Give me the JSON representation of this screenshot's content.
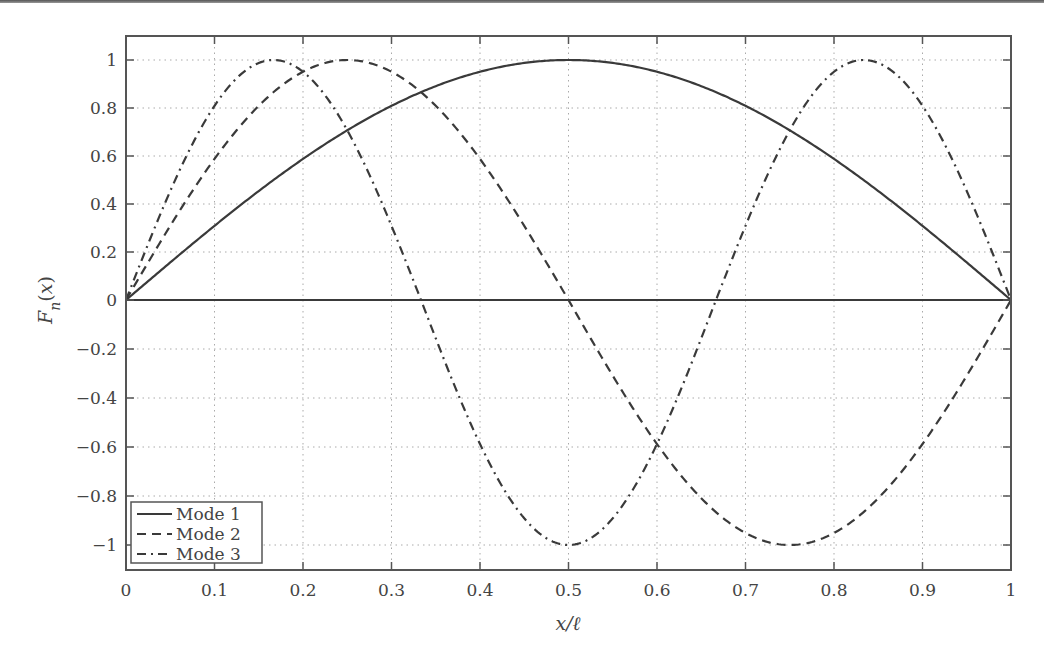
{
  "chart_data": {
    "type": "line",
    "title": "",
    "xlabel": "x/ℓ",
    "ylabel": "F_n(x)",
    "xlim": [
      0,
      1
    ],
    "ylim": [
      -1.1,
      1.1
    ],
    "grid": true,
    "legend_position": "lower left",
    "x_ticks": [
      "0",
      "0.1",
      "0.2",
      "0.3",
      "0.4",
      "0.5",
      "0.6",
      "0.7",
      "0.8",
      "0.9",
      "1"
    ],
    "y_ticks": [
      "1",
      "0.8",
      "0.6",
      "0.4",
      "0.2",
      "0",
      "-0.2",
      "-0.4",
      "-0.6",
      "-0.8",
      "-1"
    ],
    "y_tick_values": [
      1,
      0.8,
      0.6,
      0.4,
      0.2,
      0,
      -0.2,
      -0.4,
      -0.6,
      -0.8,
      -1
    ],
    "series": [
      {
        "name": "Mode 1",
        "style": "solid",
        "function": "sin(1*pi*x)",
        "x": [
          0,
          0.1,
          0.2,
          0.3,
          0.4,
          0.5,
          0.6,
          0.7,
          0.8,
          0.9,
          1
        ],
        "values": [
          0,
          0.31,
          0.59,
          0.81,
          0.95,
          1,
          0.95,
          0.81,
          0.59,
          0.31,
          0
        ]
      },
      {
        "name": "Mode 2",
        "style": "dashed",
        "function": "sin(2*pi*x)",
        "x": [
          0,
          0.1,
          0.2,
          0.25,
          0.3,
          0.4,
          0.5,
          0.6,
          0.7,
          0.75,
          0.8,
          0.9,
          1
        ],
        "values": [
          0,
          0.59,
          0.95,
          1,
          0.95,
          0.59,
          0,
          -0.59,
          -0.95,
          -1,
          -0.95,
          -0.59,
          0
        ]
      },
      {
        "name": "Mode 3",
        "style": "dash-dot",
        "function": "sin(3*pi*x)",
        "x": [
          0,
          0.1,
          0.167,
          0.2,
          0.3,
          0.333,
          0.4,
          0.5,
          0.6,
          0.667,
          0.7,
          0.8,
          0.833,
          0.9,
          1
        ],
        "values": [
          0,
          0.81,
          1,
          0.95,
          0.31,
          0,
          -0.59,
          -1,
          -0.59,
          0,
          0.31,
          0.95,
          1,
          0.81,
          0
        ]
      }
    ],
    "zero_line": true
  },
  "legend": {
    "items": [
      {
        "label": "Mode 1",
        "style": "solid"
      },
      {
        "label": "Mode 2",
        "style": "dashed"
      },
      {
        "label": "Mode 3",
        "style": "dash-dot"
      }
    ]
  },
  "colors": {
    "line": "#3a3a3a",
    "axis": "#555555",
    "grid": "#aaaaaa",
    "text": "#444444"
  }
}
